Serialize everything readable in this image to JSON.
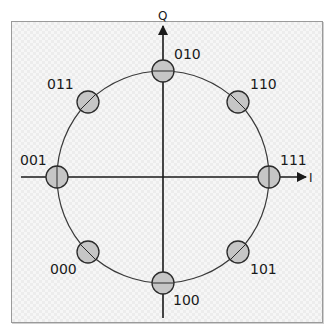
{
  "diagram": {
    "type": "8-PSK constellation",
    "axes": {
      "in_phase_label": "I",
      "quadrature_label": "Q"
    },
    "colors": {
      "point_fill": "#c6c6c6",
      "point_stroke": "#2b2b2b",
      "axis": "#1a1a1a",
      "circle": "#3a3a3a"
    },
    "points": [
      {
        "symbol": "111",
        "angle_deg": 0
      },
      {
        "symbol": "110",
        "angle_deg": 45
      },
      {
        "symbol": "010",
        "angle_deg": 90
      },
      {
        "symbol": "011",
        "angle_deg": 135
      },
      {
        "symbol": "001",
        "angle_deg": 180
      },
      {
        "symbol": "000",
        "angle_deg": 225
      },
      {
        "symbol": "100",
        "angle_deg": 270
      },
      {
        "symbol": "101",
        "angle_deg": 315
      }
    ]
  }
}
